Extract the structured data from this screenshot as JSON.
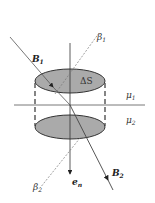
{
  "diagram": {
    "title": "",
    "labels": {
      "B1": {
        "main": "B",
        "sub": "1"
      },
      "B2": {
        "main": "B",
        "sub": "2"
      },
      "beta1": {
        "main": "β",
        "sub": "1"
      },
      "beta2": {
        "main": "β",
        "sub": "2"
      },
      "mu1": {
        "main": "μ",
        "sub": "1"
      },
      "mu2": {
        "main": "μ",
        "sub": "2"
      },
      "dS": "ΔS",
      "en": {
        "main": "e",
        "sub": "n"
      }
    },
    "colors": {
      "fill": "#a9a9a9",
      "line": "#333333",
      "dashed": "#777777"
    }
  }
}
